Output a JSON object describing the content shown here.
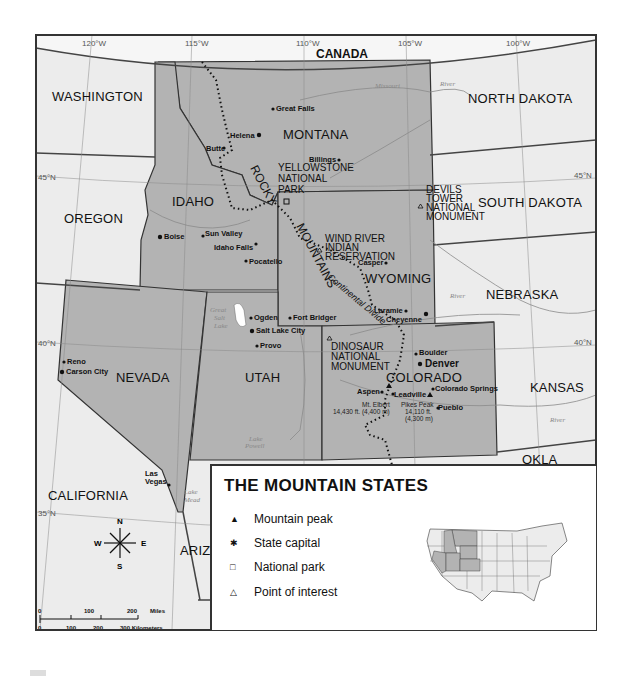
{
  "map": {
    "title": "THE MOUNTAIN STATES",
    "country_label": "CANADA",
    "longitudes": [
      "120°W",
      "115°W",
      "110°W",
      "105°W",
      "100°W"
    ],
    "latitudes": [
      "45°N",
      "45°N",
      "40°N",
      "40°N",
      "35°N"
    ],
    "mountain_states": [
      "MONTANA",
      "IDAHO",
      "WYOMING",
      "NEVADA",
      "UTAH",
      "COLORADO"
    ],
    "neighbor_states": [
      "WASHINGTON",
      "OREGON",
      "NORTH DAKOTA",
      "SOUTH DAKOTA",
      "NEBRASKA",
      "KANSAS",
      "OKLA",
      "CALIFORNIA",
      "ARIZ."
    ],
    "cities": {
      "great_falls": "Great\nFalls",
      "helena": "Helena",
      "butte": "Butte",
      "billings": "Billings",
      "boise": "Boise",
      "sun_valley": "Sun Valley",
      "idaho_falls": "Idaho Falls",
      "pocatello": "Pocatello",
      "casper": "Casper",
      "laramie": "Laramie",
      "cheyenne": "Cheyenne",
      "ogden": "Ogden",
      "fort_bridger": "Fort Bridger",
      "salt_lake_city": "Salt Lake City",
      "provo": "Provo",
      "reno": "Reno",
      "carson_city": "Carson City",
      "las_vegas_1": "Las",
      "las_vegas_2": "Vegas",
      "boulder": "Boulder",
      "denver": "Denver",
      "aspen": "Aspen",
      "leadville": "Leadville",
      "colorado_springs": "Colorado Springs",
      "pueblo": "Pueblo"
    },
    "peaks": {
      "mt_elbert": [
        "Mt. Elbert",
        "14,430 ft. (4,400 m)"
      ],
      "pikes_peak": [
        "Pikes Peak",
        "14,110 ft.",
        "(4,300 m)"
      ]
    },
    "points_of_interest": {
      "yellowstone": [
        "YELLOWSTONE",
        "NATIONAL",
        "PARK"
      ],
      "devils_tower": [
        "DEVILS",
        "TOWER",
        "NATIONAL",
        "MONUMENT"
      ],
      "wind_river": [
        "WIND RIVER",
        "INDIAN",
        "RESERVATION"
      ],
      "dinosaur": [
        "DINOSAUR",
        "NATIONAL",
        "MONUMENT"
      ]
    },
    "features": {
      "rocky_1": "ROCKY",
      "rocky_2": "MOUNTAINS",
      "divide": "Continental Divide",
      "great_salt_lake": [
        "Great",
        "Salt",
        "Lake"
      ],
      "lake_mead": [
        "Lake",
        "Mead"
      ],
      "lake_powell": [
        "Lake",
        "Powell"
      ]
    },
    "rivers": [
      "Missouri",
      "River",
      "Yellowstone River",
      "Bighorn River",
      "North Platte",
      "River",
      "South Platte",
      "River",
      "Green River",
      "Colorado River",
      "Arkansas",
      "River",
      "Rio Grande",
      "Snake River"
    ],
    "compass": {
      "n": "N",
      "s": "S",
      "e": "E",
      "w": "W"
    },
    "scale": {
      "miles": [
        "0",
        "100",
        "200",
        "Miles"
      ],
      "km": [
        "0",
        "100",
        "200",
        "300 Kilometers"
      ]
    }
  },
  "legend": {
    "title": "THE MOUNTAIN STATES",
    "items": [
      {
        "symbol": "▲",
        "label": "Mountain peak"
      },
      {
        "symbol": "✱",
        "label": "State capital"
      },
      {
        "symbol": "□",
        "label": "National park"
      },
      {
        "symbol": "△",
        "label": "Point of interest"
      }
    ]
  },
  "colors": {
    "mountain_states": "#b3b3b3",
    "other_land": "#ececec",
    "border": "#333333",
    "background": "#ffffff"
  }
}
